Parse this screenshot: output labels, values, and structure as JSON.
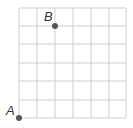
{
  "grid": {
    "cols": 6,
    "rows": 6,
    "line_color": "#cfcfcf"
  },
  "points": [
    {
      "label": "A",
      "x": 0,
      "y": 0,
      "color": "#555555"
    },
    {
      "label": "B",
      "x": 2,
      "y": 5,
      "color": "#555555"
    }
  ]
}
